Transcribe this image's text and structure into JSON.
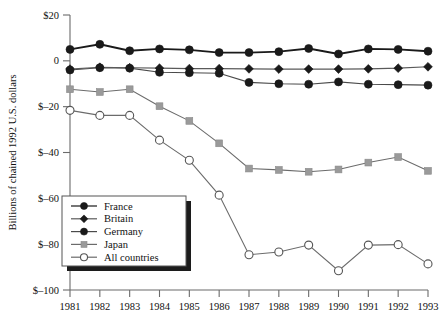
{
  "chart_data": {
    "type": "line",
    "title": "",
    "xlabel": "",
    "ylabel": "Billions of chained 1992 U.S. dollars",
    "categories": [
      "1981",
      "1982",
      "1983",
      "1984",
      "1985",
      "1986",
      "1987",
      "1988",
      "1989",
      "1990",
      "1991",
      "1992",
      "1993"
    ],
    "x": [
      1981,
      1982,
      1983,
      1984,
      1985,
      1986,
      1987,
      1988,
      1989,
      1990,
      1991,
      1992,
      1993
    ],
    "xlim": [
      1981,
      1993
    ],
    "ylim": [
      -100,
      20
    ],
    "ytick_labels": [
      "$20",
      "0",
      "$–20",
      "$–40",
      "$–60",
      "$–80",
      "$–100"
    ],
    "ytick_values": [
      20,
      0,
      -20,
      -40,
      -60,
      -80,
      -100
    ],
    "grid": false,
    "legend_position": "lower-left-inside",
    "series": [
      {
        "name": "France",
        "marker": "filled-circle",
        "color": "#1a1a1a",
        "line_color": "#1a1a1a",
        "values": [
          5.0,
          7.2,
          4.4,
          5.2,
          4.8,
          3.6,
          3.6,
          4.0,
          5.4,
          3.0,
          5.2,
          5.0,
          4.2
        ]
      },
      {
        "name": "Britain",
        "marker": "filled-diamond",
        "color": "#1a1a1a",
        "line_color": "#5a5a5a",
        "values": [
          -3.6,
          -2.8,
          -3.0,
          -3.2,
          -3.4,
          -3.4,
          -3.5,
          -3.6,
          -3.6,
          -3.6,
          -3.5,
          -3.2,
          -2.6
        ]
      },
      {
        "name": "Germany",
        "marker": "filled-circle",
        "color": "#1a1a1a",
        "line_color": "#4a4a4a",
        "values": [
          -4.0,
          -3.0,
          -3.2,
          -5.0,
          -5.2,
          -5.4,
          -9.4,
          -10.0,
          -10.2,
          -9.2,
          -10.2,
          -10.4,
          -10.6
        ]
      },
      {
        "name": "Japan",
        "marker": "filled-square",
        "color": "#9a9a9a",
        "line_color": "#6b6b6b",
        "values": [
          -12.4,
          -13.6,
          -12.4,
          -19.8,
          -26.2,
          -36.0,
          -47.0,
          -47.6,
          -48.4,
          -47.4,
          -44.4,
          -42.0,
          -48.0
        ]
      },
      {
        "name": "All countries",
        "marker": "open-circle",
        "color": "#ffffff",
        "line_color": "#6b6b6b",
        "values": [
          -21.6,
          -23.8,
          -23.8,
          -34.6,
          -43.4,
          -58.6,
          -84.6,
          -83.4,
          -80.4,
          -91.6,
          -80.4,
          -80.2,
          -88.6
        ]
      }
    ]
  },
  "legend": {
    "items": [
      {
        "label": "France"
      },
      {
        "label": "Britain"
      },
      {
        "label": "Germany"
      },
      {
        "label": "Japan"
      },
      {
        "label": "All countries"
      }
    ]
  }
}
